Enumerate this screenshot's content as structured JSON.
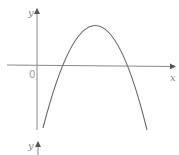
{
  "diagram": {
    "type": "function-graph",
    "axes": {
      "x_label": "x",
      "y_label": "y",
      "origin_label": "0"
    },
    "curve": {
      "shape": "parabola",
      "opens": "down",
      "vertex_quadrant": "I",
      "x_intercepts": "both positive"
    },
    "second_axis_fragment": {
      "y_label": "y"
    },
    "colors": {
      "axis": "#777777",
      "curve": "#666666",
      "label": "#8a8a8a"
    }
  }
}
